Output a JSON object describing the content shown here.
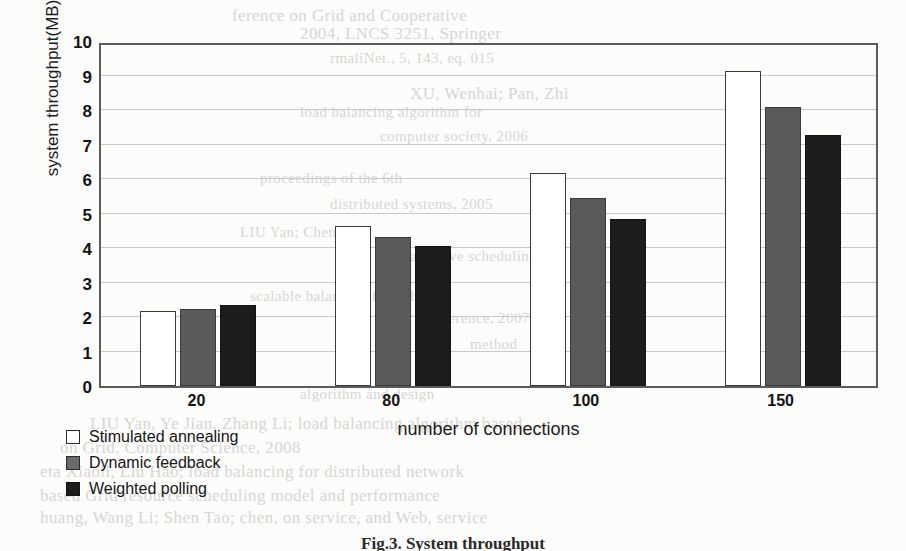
{
  "figure": {
    "caption": "Fig.3. System throughput"
  },
  "legend": {
    "position": "below-left",
    "items": [
      {
        "label": "Stimulated annealing",
        "swatch": "white-square-icon",
        "color": "#ffffff"
      },
      {
        "label": "Dynamic feedback",
        "swatch": "gray-square-icon",
        "color": "#5a5a5a"
      },
      {
        "label": "Weighted polling",
        "swatch": "black-square-icon",
        "color": "#1c1c1c"
      }
    ]
  },
  "chart_data": {
    "type": "bar",
    "title": "",
    "subtitle": "",
    "xlabel": "number of connections",
    "ylabel": "system throughput(MB)",
    "categories": [
      "20",
      "80",
      "100",
      "150"
    ],
    "series": [
      {
        "name": "Stimulated annealing",
        "color": "#ffffff",
        "values": [
          2.17,
          4.65,
          6.17,
          9.13
        ]
      },
      {
        "name": "Dynamic feedback",
        "color": "#5a5a5a",
        "values": [
          2.23,
          4.33,
          5.45,
          8.08
        ]
      },
      {
        "name": "Weighted polling",
        "color": "#1c1c1c",
        "values": [
          2.35,
          4.07,
          4.85,
          7.27
        ]
      }
    ],
    "ylim": [
      0,
      10
    ],
    "yticks": [
      0,
      1,
      2,
      3,
      4,
      5,
      6,
      7,
      8,
      9,
      10
    ],
    "ytick_labels": [
      "0",
      "1",
      "2",
      "3",
      "4",
      "5",
      "6",
      "7",
      "8",
      "9",
      "10"
    ],
    "grid": true,
    "grid_axis": "y",
    "legend_position": "below-left",
    "plot_border": true
  },
  "background_text": {
    "note": "faint bleed-through text from reverse side of scanned page",
    "lines": [
      {
        "text": "ference on Grid and Cooperative",
        "x": 232,
        "y": 6,
        "size": "md"
      },
      {
        "text": "2004, LNCS 3251, Springer",
        "x": 300,
        "y": 24,
        "size": "md"
      },
      {
        "text": "rmaliNet., 5, 143, eq. 015",
        "x": 330,
        "y": 50,
        "size": "sm"
      },
      {
        "text": "XU, Wenhai; Pan, Zhi",
        "x": 410,
        "y": 84,
        "size": "md"
      },
      {
        "text": "load balancing algorithm for",
        "x": 300,
        "y": 104,
        "size": "sm"
      },
      {
        "text": "computer society, 2006",
        "x": 380,
        "y": 128,
        "size": "sm"
      },
      {
        "text": "proceedings of the 6th",
        "x": 260,
        "y": 170,
        "size": "sm"
      },
      {
        "text": "distributed systems, 2005",
        "x": 330,
        "y": 196,
        "size": "sm"
      },
      {
        "text": "LIU Yan; Chen Yu",
        "x": 240,
        "y": 224,
        "size": "sm"
      },
      {
        "text": "adaptive scheduling",
        "x": 410,
        "y": 248,
        "size": "sm"
      },
      {
        "text": "scalable balancing for public",
        "x": 250,
        "y": 288,
        "size": "sm"
      },
      {
        "text": "conference, 2007",
        "x": 420,
        "y": 310,
        "size": "sm"
      },
      {
        "text": "method",
        "x": 470,
        "y": 336,
        "size": "sm"
      },
      {
        "text": "algorithm and design",
        "x": 300,
        "y": 386,
        "size": "sm"
      },
      {
        "text": "LIU Yan, Ye Jian, Zhang Li; load balancing algorithm based",
        "x": 90,
        "y": 414,
        "size": "md"
      },
      {
        "text": "on Grid, Computer Science, 2008",
        "x": 60,
        "y": 438,
        "size": "md"
      },
      {
        "text": "eta Xiaoli, Liu Hao; load balancing for distributed network",
        "x": 40,
        "y": 462,
        "size": "md"
      },
      {
        "text": "based Grid resource scheduling model and performance",
        "x": 40,
        "y": 486,
        "size": "md"
      },
      {
        "text": "huang, Wang Li; Shen Tao; chen, on service, and Web, service",
        "x": 40,
        "y": 508,
        "size": "md"
      }
    ]
  }
}
